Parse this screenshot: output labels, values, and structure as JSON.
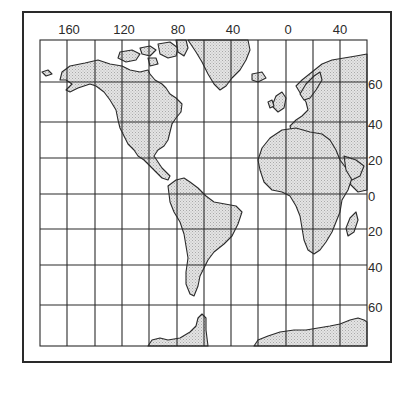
{
  "map": {
    "projection": "Mercator",
    "colors": {
      "land_fill": "#d9d9d9",
      "line": "#2b2b2b",
      "background": "#ffffff"
    },
    "longitude_labels": [
      {
        "label": "160",
        "x": 69
      },
      {
        "label": "120",
        "x": 124
      },
      {
        "label": "80",
        "x": 178
      },
      {
        "label": "40",
        "x": 233
      },
      {
        "label": "0",
        "x": 288
      },
      {
        "label": "40",
        "x": 340
      }
    ],
    "latitude_labels": [
      {
        "label": "60",
        "y": 82
      },
      {
        "label": "40",
        "y": 122
      },
      {
        "label": "20",
        "y": 158
      },
      {
        "label": "0",
        "y": 194
      },
      {
        "label": "20",
        "y": 229
      },
      {
        "label": "40",
        "y": 265
      },
      {
        "label": "60",
        "y": 305
      }
    ],
    "regions": [
      "North America",
      "Greenland",
      "South America",
      "Europe",
      "Africa",
      "Antarctica"
    ]
  }
}
